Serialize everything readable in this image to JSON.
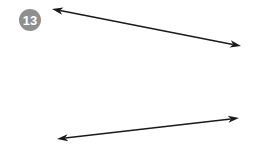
{
  "figure": {
    "width": 261,
    "height": 146,
    "background_color": "#ffffff"
  },
  "badge": {
    "label": "13",
    "shape": "circle",
    "fill_color": "#8f8f8f",
    "text_color": "#ffffff",
    "center_x": 30,
    "center_y": 20,
    "radius": 11
  },
  "style": {
    "line_color": "#1a1a1a",
    "line_width": 1.6,
    "arrowhead_length": 11,
    "arrowhead_half_width": 3.6,
    "arrowhead_notch": 3
  },
  "arrows": [
    {
      "name": "top-arrow",
      "heads": "both",
      "x1": 52,
      "y1": 9,
      "x2": 241,
      "y2": 46,
      "direction": "down-right",
      "length_px": 193
    },
    {
      "name": "bottom-arrow",
      "heads": "both",
      "x1": 57,
      "y1": 139,
      "x2": 239,
      "y2": 118,
      "direction": "up-right",
      "length_px": 183
    }
  ]
}
